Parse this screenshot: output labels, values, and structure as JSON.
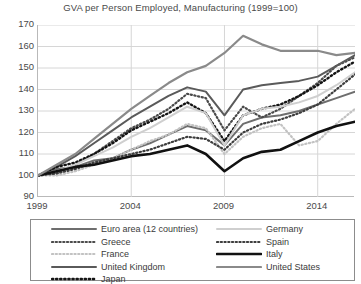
{
  "chart_data": {
    "type": "line",
    "title": "GVA per Person Employed, Manufacturing (1999=100)",
    "xlabel": "",
    "ylabel": "",
    "xlim": [
      1999,
      2016
    ],
    "ylim": [
      90,
      170
    ],
    "ytick_values": [
      170,
      160,
      150,
      140,
      130,
      120,
      110,
      100,
      90
    ],
    "xtick_values": [
      1999,
      2004,
      2009,
      2014
    ],
    "grid": true,
    "legend_position": "bottom",
    "x": [
      1999,
      2000,
      2001,
      2002,
      2003,
      2004,
      2005,
      2006,
      2007,
      2008,
      2009,
      2010,
      2011,
      2012,
      2013,
      2014,
      2015,
      2016
    ],
    "series": [
      {
        "name": "Euro area (12 countries)",
        "color": "#6e6e6e",
        "style": "solid",
        "width": 2,
        "values": [
          100,
          103,
          104,
          107,
          108,
          112,
          115,
          119,
          123,
          121,
          114,
          124,
          127,
          128,
          130,
          133,
          136,
          139
        ]
      },
      {
        "name": "Greece",
        "color": "#4a4a4a",
        "style": "dotted",
        "width": 2.2,
        "values": [
          100,
          101,
          105,
          110,
          116,
          122,
          126,
          131,
          138,
          136,
          121,
          132,
          127,
          131,
          137,
          143,
          151,
          155
        ]
      },
      {
        "name": "France",
        "color": "#c2c2c2",
        "style": "dotted",
        "width": 2.2,
        "values": [
          100,
          100,
          102,
          105,
          108,
          112,
          116,
          119,
          124,
          122,
          110,
          118,
          122,
          124,
          114,
          116,
          124,
          131
        ]
      },
      {
        "name": "United Kingdom",
        "color": "#5a5a5a",
        "style": "solid",
        "width": 2,
        "values": [
          100,
          104,
          109,
          115,
          121,
          127,
          132,
          137,
          141,
          139,
          128,
          140,
          142,
          143,
          144,
          146,
          151,
          156
        ]
      },
      {
        "name": "Japan",
        "color": "#141414",
        "style": "dotted",
        "width": 2.4,
        "values": [
          100,
          104,
          106,
          110,
          115,
          121,
          125,
          129,
          134,
          129,
          116,
          128,
          131,
          133,
          137,
          142,
          148,
          153
        ]
      },
      {
        "name": "Germany",
        "color": "#cfcfcf",
        "style": "solid",
        "width": 2,
        "values": [
          100,
          102,
          105,
          109,
          113,
          118,
          122,
          127,
          132,
          129,
          114,
          128,
          131,
          132,
          134,
          137,
          142,
          148
        ]
      },
      {
        "name": "Spain",
        "color": "#3d3d3d",
        "style": "dotted",
        "width": 2.2,
        "values": [
          100,
          101,
          103,
          106,
          108,
          110,
          112,
          115,
          118,
          117,
          112,
          120,
          124,
          126,
          129,
          133,
          140,
          147
        ]
      },
      {
        "name": "Italy",
        "color": "#111111",
        "style": "solid",
        "width": 2.6,
        "values": [
          100,
          102,
          104,
          105,
          107,
          109,
          110,
          112,
          114,
          110,
          102,
          108,
          111,
          112,
          116,
          120,
          123,
          125
        ]
      },
      {
        "name": "United States",
        "color": "#8a8a8a",
        "style": "solid",
        "width": 2.2,
        "values": [
          100,
          105,
          110,
          117,
          124,
          131,
          137,
          143,
          148,
          151,
          157,
          165,
          161,
          158,
          158,
          158,
          156,
          157
        ]
      }
    ]
  },
  "legend": {
    "left_column": [
      {
        "label": "Euro area (12 countries)"
      },
      {
        "label": "Greece"
      },
      {
        "label": "France"
      },
      {
        "label": "United Kingdom"
      },
      {
        "label": "Japan"
      }
    ],
    "right_column": [
      {
        "label": "Germany"
      },
      {
        "label": "Spain"
      },
      {
        "label": "Italy"
      },
      {
        "label": "United States"
      }
    ]
  }
}
